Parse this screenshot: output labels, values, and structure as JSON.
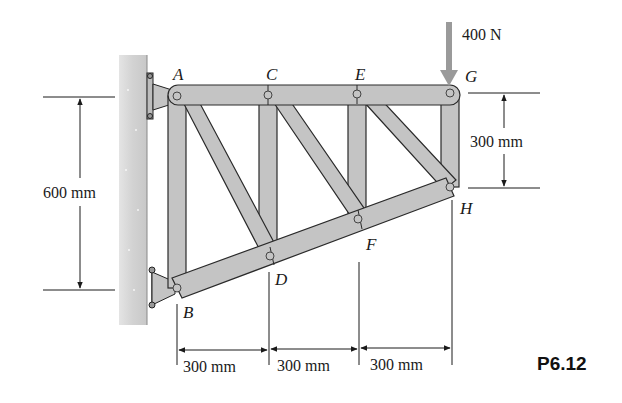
{
  "figure": {
    "id": "P6.12",
    "type": "truss",
    "load": {
      "label": "400 N",
      "at_joint": "G",
      "direction": "down",
      "color": "#9a9a9a"
    },
    "joints": {
      "A": {
        "label": "A"
      },
      "B": {
        "label": "B"
      },
      "C": {
        "label": "C"
      },
      "D": {
        "label": "D"
      },
      "E": {
        "label": "E"
      },
      "F": {
        "label": "F"
      },
      "G": {
        "label": "G"
      },
      "H": {
        "label": "H"
      }
    },
    "members": [
      "AC",
      "CE",
      "EG",
      "BD",
      "DF",
      "FH",
      "AB",
      "CD",
      "EF",
      "GH",
      "AD",
      "CF",
      "EH"
    ],
    "dimensions": {
      "left_height": "600 mm",
      "right_height": "300 mm",
      "spans": [
        "300 mm",
        "300 mm",
        "300 mm"
      ]
    },
    "colors": {
      "member": "#c4c4c4",
      "member_edge": "#2a2a2a",
      "wall": "#d9d9d9",
      "load_arrow": "#9a9a9a"
    }
  }
}
